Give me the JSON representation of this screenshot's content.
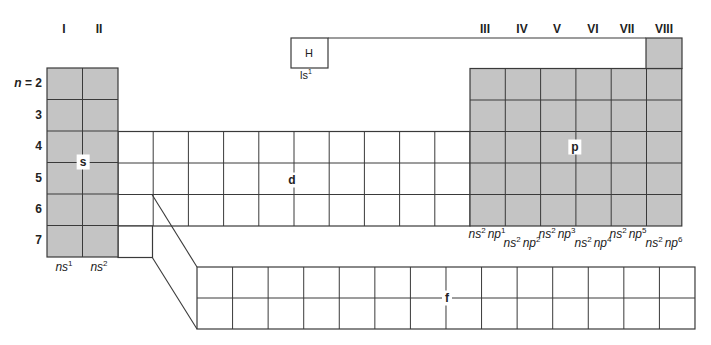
{
  "diagram": {
    "colors": {
      "shaded": "#c4c4c4",
      "line": "#3a3a3a",
      "background": "#ffffff"
    },
    "groups": [
      {
        "label": "I",
        "x": 64
      },
      {
        "label": "II",
        "x": 99
      },
      {
        "label": "III",
        "x": 485
      },
      {
        "label": "IV",
        "x": 522
      },
      {
        "label": "V",
        "x": 557
      },
      {
        "label": "VI",
        "x": 593
      },
      {
        "label": "VII",
        "x": 627
      },
      {
        "label": "VIII",
        "x": 664
      }
    ],
    "periods": [
      {
        "label": "n = 2",
        "n_prefix": "n",
        "value": "= 2",
        "y": 84
      },
      {
        "label": "3",
        "y": 116
      },
      {
        "label": "4",
        "y": 147
      },
      {
        "label": "5",
        "y": 179
      },
      {
        "label": "6",
        "y": 210
      },
      {
        "label": "7",
        "y": 241
      }
    ],
    "hydrogen": {
      "symbol": "H",
      "config": "ls",
      "config_sup": "1"
    },
    "blocks": {
      "s": {
        "label": "s",
        "columns": 2,
        "rows": 6
      },
      "p": {
        "label": "p",
        "columns": 6,
        "rows": 5
      },
      "d": {
        "label": "d",
        "columns": 10,
        "rows": 3
      },
      "f": {
        "label": "f",
        "columns": 14,
        "rows": 2
      }
    },
    "s_configs": [
      {
        "base": "ns",
        "sup": "1",
        "x": 64
      },
      {
        "base": "ns",
        "sup": "2",
        "x": 99
      }
    ],
    "p_configs": [
      {
        "text1": "ns",
        "sup1": "2",
        "text2": "np",
        "sup2": "1",
        "x": 487,
        "y": 228
      },
      {
        "text1": "ns",
        "sup1": "2",
        "text2": "np",
        "sup2": "2",
        "x": 522,
        "y": 237
      },
      {
        "text1": "ns",
        "sup1": "2",
        "text2": "np",
        "sup2": "3",
        "x": 557,
        "y": 228
      },
      {
        "text1": "ns",
        "sup1": "2",
        "text2": "np",
        "sup2": "4",
        "x": 593,
        "y": 237
      },
      {
        "text1": "ns",
        "sup1": "2",
        "text2": "np",
        "sup2": "5",
        "x": 628,
        "y": 228
      },
      {
        "text1": "ns",
        "sup1": "2",
        "text2": "np",
        "sup2": "6",
        "x": 664,
        "y": 237
      }
    ]
  }
}
